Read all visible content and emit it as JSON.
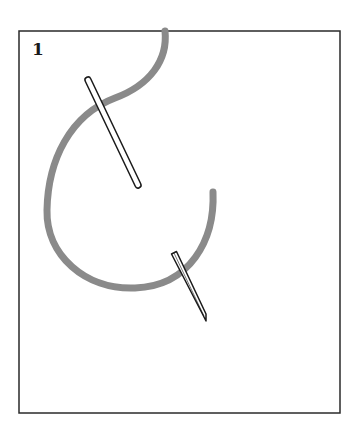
{
  "figure": {
    "step_number": "1",
    "frame": {
      "x": 19,
      "y": 31,
      "width": 321,
      "height": 382,
      "stroke": "#2a2a2a"
    },
    "yarn": {
      "color": "#8a8a8a",
      "stroke_width": 7,
      "path": "M165 31 C168 60 150 85 115 98 C70 115 48 160 47 210 C46 255 85 290 135 288 C190 286 215 240 213 192"
    },
    "needles": [
      {
        "name": "upper-needle",
        "from": [
          88,
          80
        ],
        "to": [
          138,
          185
        ],
        "width": 6,
        "fill": "#ffffff",
        "stroke": "#1a1a1a",
        "tip": "blunt"
      },
      {
        "name": "lower-needle",
        "from": [
          174,
          253
        ],
        "to": [
          206,
          320
        ],
        "width": 5,
        "fill": "#ffffff",
        "stroke": "#1a1a1a",
        "tip": "pointed"
      }
    ]
  }
}
